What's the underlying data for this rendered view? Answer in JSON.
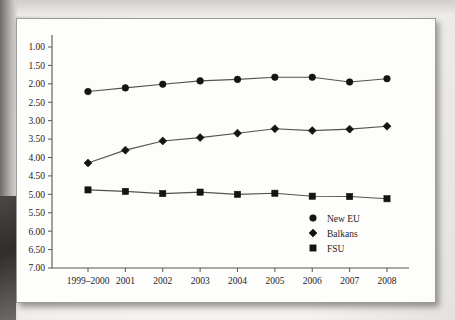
{
  "page": {
    "caption_fragment": "",
    "background_color": "#ece9e6",
    "card_color": "#fdfdfc"
  },
  "chart_data": {
    "type": "line",
    "title": "",
    "subtitle": "",
    "xlabel": "",
    "ylabel": "",
    "categories": [
      "1999–2000",
      "2001",
      "2002",
      "2003",
      "2004",
      "2005",
      "2006",
      "2007",
      "2008"
    ],
    "ylim": [
      1.0,
      7.0
    ],
    "y_axis_inverted": true,
    "y_ticks": [
      "1.00",
      "1.50",
      "2.00",
      "2.50",
      "3.00",
      "3.50",
      "4.00",
      "4.50",
      "5.00",
      "5.50",
      "6.00",
      "6.50",
      "7.00"
    ],
    "y_tick_values": [
      1.0,
      1.5,
      2.0,
      2.5,
      3.0,
      3.5,
      4.0,
      4.5,
      5.0,
      5.5,
      6.0,
      6.5,
      7.0
    ],
    "grid": false,
    "legend_position": "lower-right",
    "series": [
      {
        "name": "New EU",
        "marker": "circle",
        "color": "#15140f",
        "values": [
          2.21,
          2.11,
          2.01,
          1.92,
          1.88,
          1.82,
          1.82,
          1.95,
          1.86
        ]
      },
      {
        "name": "Balkans",
        "marker": "diamond",
        "color": "#15140f",
        "values": [
          4.15,
          3.8,
          3.55,
          3.46,
          3.34,
          3.22,
          3.27,
          3.23,
          3.15
        ]
      },
      {
        "name": "FSU",
        "marker": "square",
        "color": "#15140f",
        "values": [
          4.88,
          4.92,
          4.98,
          4.94,
          5.0,
          4.97,
          5.05,
          5.06,
          5.12
        ]
      }
    ]
  }
}
